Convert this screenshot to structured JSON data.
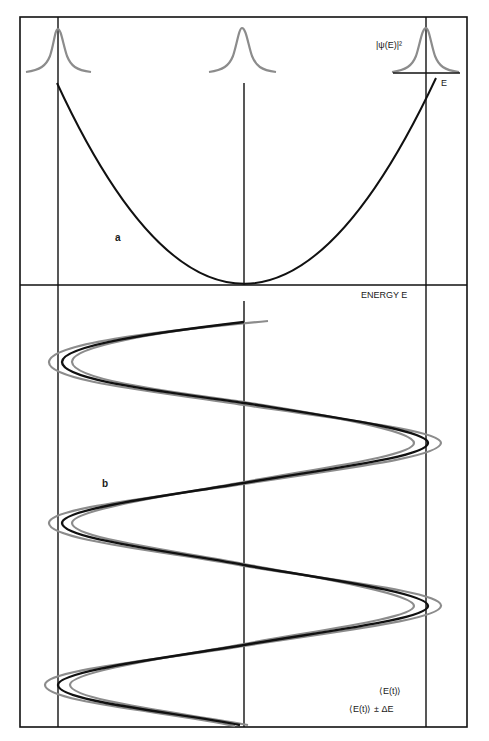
{
  "figure": {
    "panel_a": {
      "letter": "a",
      "wavefunction_label": "|ψ(E)|²",
      "energy_axis_label": "E",
      "gaussian_centers_x": [
        58,
        243,
        426
      ]
    },
    "panel_b": {
      "letter": "b",
      "axis_label": "ENERGY E",
      "legend": [
        {
          "label": "⟨E(t)⟩",
          "color": "#111111"
        },
        {
          "label": "⟨E(t)⟩ ± ΔE",
          "color": "#8c8c8c"
        }
      ]
    },
    "colors": {
      "frame": "#111111",
      "mean_curve": "#111111",
      "uncertainty_curve": "#8c8c8c",
      "gaussian": "#8c8c8c"
    }
  }
}
